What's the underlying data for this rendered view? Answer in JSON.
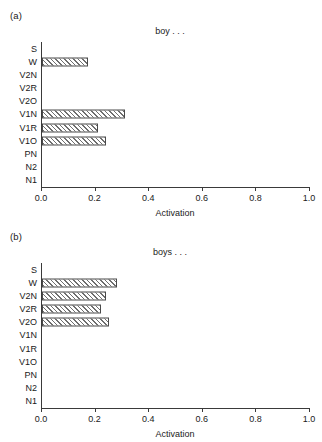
{
  "figure": {
    "panels": [
      {
        "panel_label": "(a)",
        "title": "boy . . ."
      },
      {
        "panel_label": "(b)",
        "title": "boys . . ."
      }
    ]
  },
  "axis": {
    "xlabel": "Activation",
    "tick_labels": [
      "0.0",
      "0.2",
      "0.4",
      "0.6",
      "0.8",
      "1.0"
    ],
    "tick_values": [
      0.0,
      0.2,
      0.4,
      0.6,
      0.8,
      1.0
    ]
  },
  "chart_data": [
    {
      "type": "bar",
      "orientation": "horizontal",
      "title": "boy . . .",
      "panel_label": "(a)",
      "xlabel": "Activation",
      "ylabel": "",
      "xlim": [
        0.0,
        1.0
      ],
      "grid": false,
      "legend": "none",
      "categories": [
        "S",
        "W",
        "V2N",
        "V2R",
        "V2O",
        "V1N",
        "V1R",
        "V1O",
        "PN",
        "N2",
        "N1"
      ],
      "values": [
        0.0,
        0.17,
        0.0,
        0.0,
        0.0,
        0.31,
        0.21,
        0.24,
        0.0,
        0.0,
        0.0
      ],
      "tick_labels": [
        "0.0",
        "0.2",
        "0.4",
        "0.6",
        "0.8",
        "1.0"
      ]
    },
    {
      "type": "bar",
      "orientation": "horizontal",
      "title": "boys . . .",
      "panel_label": "(b)",
      "xlabel": "Activation",
      "ylabel": "",
      "xlim": [
        0.0,
        1.0
      ],
      "grid": false,
      "legend": "none",
      "categories": [
        "S",
        "W",
        "V2N",
        "V2R",
        "V2O",
        "V1N",
        "V1R",
        "V1O",
        "PN",
        "N2",
        "N1"
      ],
      "values": [
        0.0,
        0.28,
        0.24,
        0.22,
        0.25,
        0.0,
        0.0,
        0.0,
        0.0,
        0.0,
        0.0
      ],
      "tick_labels": [
        "0.0",
        "0.2",
        "0.4",
        "0.6",
        "0.8",
        "1.0"
      ]
    }
  ],
  "colors": {
    "axis": "#3a3a3a",
    "bar_edge": "#4a4a4a",
    "bar_hatch": "#6e6e6e",
    "background": "#ffffff",
    "text": "#1a1a1a"
  }
}
